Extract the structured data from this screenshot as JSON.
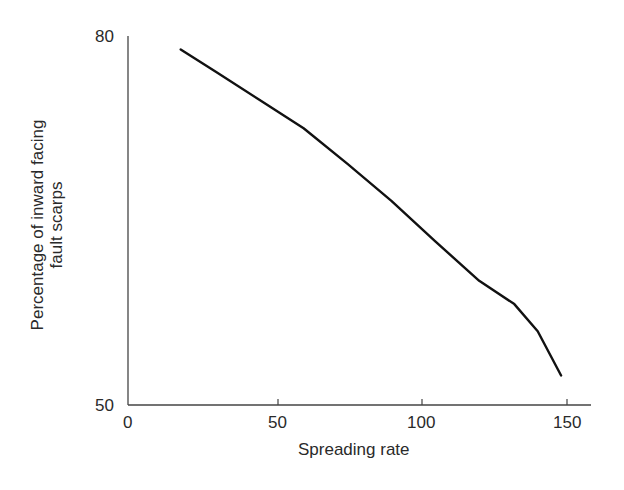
{
  "chart_data": {
    "type": "line",
    "title": "",
    "xlabel": "Spreading rate",
    "ylabel_line1": "Percentage of inward facing",
    "ylabel_line2": "fault scarps",
    "xlim": [
      0,
      150
    ],
    "ylim": [
      50,
      80
    ],
    "x_ticks": [
      "0",
      "50",
      "100",
      "150"
    ],
    "y_ticks": [
      "50",
      "80"
    ],
    "grid": false,
    "legend": null,
    "series": [
      {
        "name": "inward facing fault scarps",
        "x": [
          18,
          30,
          45,
          60,
          75,
          90,
          105,
          120,
          132,
          140,
          148
        ],
        "y": [
          78.9,
          77.1,
          74.8,
          72.5,
          69.6,
          66.6,
          63.3,
          60.1,
          58.2,
          56.0,
          52.4
        ]
      }
    ]
  }
}
